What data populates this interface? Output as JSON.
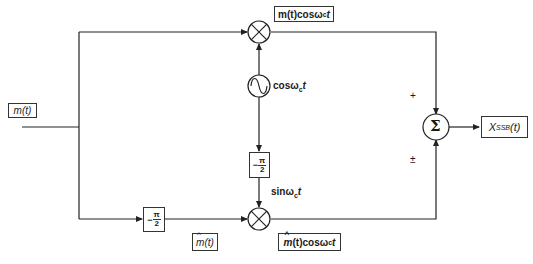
{
  "diagram": {
    "input": {
      "label": "m(t)"
    },
    "top_product": {
      "label": "m(t)cosω_ct",
      "prefix": "m(t)cos",
      "omega": "ω",
      "sub": "c",
      "suffix": "t"
    },
    "oscillator": {
      "label": "cosω_ct",
      "prefix": "cos",
      "omega": "ω",
      "sub": "c",
      "suffix": "t",
      "icon": "sine-wave"
    },
    "carrier_phase_shifter": {
      "label": "-π/2",
      "sign": "−",
      "num": "π",
      "den": "2"
    },
    "sin_carrier": {
      "label": "sinω_ct",
      "prefix": "sin",
      "omega": "ω",
      "sub": "c",
      "suffix": "t"
    },
    "hilbert_shifter": {
      "label": "-π/2",
      "sign": "−",
      "num": "π",
      "den": "2"
    },
    "hilbert_output": {
      "label": "m̂(t)",
      "m": "m",
      "rest": "(t)"
    },
    "bottom_product": {
      "label": "m̂(t)cosω_ct",
      "m": "m",
      "rest": "(t)cos",
      "omega": "ω",
      "sub": "c",
      "suffix": "t"
    },
    "summer": {
      "symbol": "Σ",
      "top_sign": "+",
      "bottom_sign": "±"
    },
    "output": {
      "label": "X_SSB(t)",
      "x": "X",
      "sub": "SSB",
      "rest": "(t)"
    },
    "multiplier_symbol": "⊗"
  }
}
